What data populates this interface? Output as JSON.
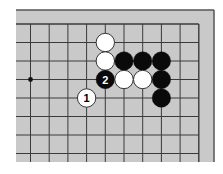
{
  "diagram": {
    "type": "go-board-fragment",
    "colors": {
      "page_background": "#ffffff",
      "board": "#c9c9c9",
      "grid_line": "#3a3a3a",
      "frame_line": "#555555",
      "black_stone": "#0a0a0a",
      "white_stone": "#ffffff",
      "white_stone_outline": "#222222",
      "star_point": "#111111"
    },
    "board": {
      "x": 16,
      "y": 10,
      "width": 198,
      "height": 152,
      "frame_edges": [
        "top",
        "right"
      ]
    },
    "grid": {
      "columns_x": [
        30.5,
        49.2,
        67.9,
        86.6,
        105.3,
        124.0,
        142.7,
        161.4,
        180.1,
        198.8
      ],
      "rows_y": [
        24,
        42.5,
        61,
        79.5,
        98,
        116.5,
        135,
        153.5
      ],
      "top_edge_row": 0,
      "right_edge_col": 9,
      "line_extend_left": 16,
      "line_extend_bottom": 162
    },
    "star_points": [
      {
        "col": 0,
        "row": 3
      }
    ],
    "stone_radius": 9.2,
    "stones": [
      {
        "col": 4,
        "row": 1,
        "color": "white",
        "label": ""
      },
      {
        "col": 4,
        "row": 2,
        "color": "white",
        "label": ""
      },
      {
        "col": 5,
        "row": 2,
        "color": "black",
        "label": ""
      },
      {
        "col": 6,
        "row": 2,
        "color": "black",
        "label": ""
      },
      {
        "col": 7,
        "row": 2,
        "color": "black",
        "label": ""
      },
      {
        "col": 4,
        "row": 3,
        "color": "black",
        "label": "2"
      },
      {
        "col": 5,
        "row": 3,
        "color": "white",
        "label": ""
      },
      {
        "col": 6,
        "row": 3,
        "color": "white",
        "label": ""
      },
      {
        "col": 7,
        "row": 3,
        "color": "black",
        "label": ""
      },
      {
        "col": 7,
        "row": 4,
        "color": "black",
        "label": ""
      },
      {
        "col": 3,
        "row": 4,
        "color": "white",
        "label": "1"
      }
    ]
  }
}
